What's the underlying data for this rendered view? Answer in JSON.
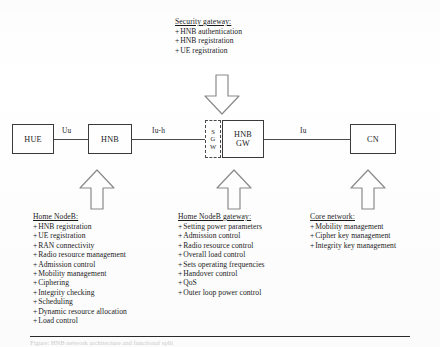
{
  "figure": {
    "bottom_caption": "Figure: HNB network architecture and functional split"
  },
  "nodes": {
    "hue": "HUE",
    "hnb": "HNB",
    "sgw": {
      "line1": "S",
      "line2": "G",
      "line3": "W"
    },
    "hnbgw": {
      "line1": "HNB",
      "line2": "GW"
    },
    "cn": "CN"
  },
  "interfaces": {
    "uu": "Uu",
    "iuh": "Iu-h",
    "iu": "Iu"
  },
  "notes": {
    "security_gateway": {
      "heading": "Security gateway:",
      "items": [
        "HNB authentication",
        "HNB registration",
        "UE registration"
      ]
    },
    "home_nodeb": {
      "heading": "Home NodeB:",
      "items": [
        "HNB registration",
        "UE registration",
        "RAN connectivity",
        "Radio resource management",
        "Admission control",
        "Mobility management",
        "Ciphering",
        "Integrity checking",
        "Scheduling",
        "Dynamic resource allocation",
        "Load control"
      ]
    },
    "home_nodeb_gateway": {
      "heading": "Home NodeB gateway:",
      "items": [
        "Setting power parameters",
        "Admission control",
        "Radio resource control",
        "Overall load control",
        "Sets operating frequencies",
        "Handover control",
        "QoS",
        "Outer loop power control"
      ]
    },
    "core_network": {
      "heading": "Core network:",
      "items": [
        "Mobility management",
        "Cipher key management",
        "Integrity key management"
      ]
    }
  },
  "bullet_prefix": "+",
  "colors": {
    "line": "#4a4a4a",
    "box_border": "#3a3a3a",
    "arrow_stroke": "#8a8a8a",
    "text": "#1b1b1b",
    "background": "#ffffff"
  }
}
